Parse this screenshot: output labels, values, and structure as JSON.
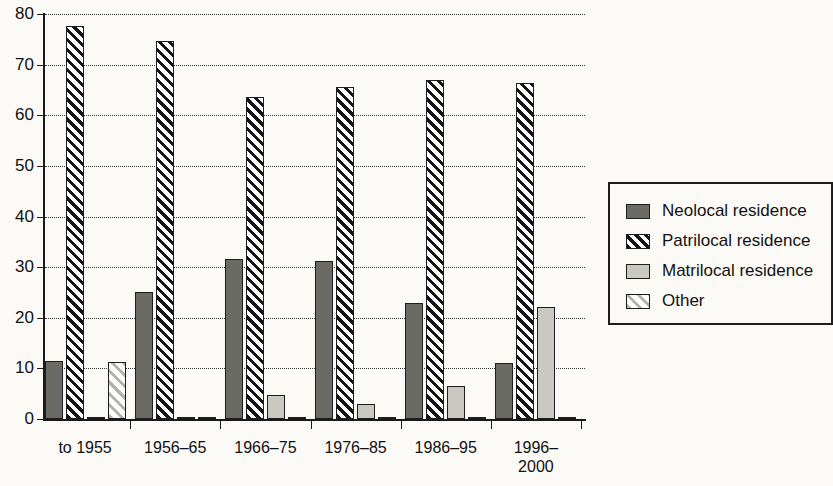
{
  "chart_data": {
    "type": "bar",
    "title": "",
    "subtitle": "",
    "xlabel": "",
    "ylabel": "",
    "ylim": [
      0,
      80
    ],
    "ytick_step": 10,
    "yticks": [
      0,
      10,
      20,
      30,
      40,
      50,
      60,
      70,
      80
    ],
    "ytick_labels": [
      "0",
      "10",
      "20",
      "30",
      "40",
      "50",
      "60",
      "70",
      "80"
    ],
    "grid": "horizontal-dotted",
    "legend_position": "right",
    "categories": [
      "to 1955",
      "1956–65",
      "1966–75",
      "1976–85",
      "1986–95",
      "1996–\n2000"
    ],
    "series": [
      {
        "name": "Neolocal residence",
        "key": "neolocal",
        "color": "#6b6b66",
        "pattern": "solid",
        "values": [
          11.5,
          25.0,
          31.6,
          31.2,
          22.9,
          11.0
        ]
      },
      {
        "name": "Patrilocal residence",
        "key": "patrilocal",
        "color": "#151515",
        "pattern": "diagonal-dark",
        "values": [
          77.6,
          74.6,
          63.6,
          65.6,
          67.0,
          66.3
        ]
      },
      {
        "name": "Matrilocal residence",
        "key": "matrilocal",
        "color": "#c9c9c2",
        "pattern": "solid",
        "values": [
          0.3,
          0.3,
          4.8,
          3.0,
          6.5,
          22.2
        ]
      },
      {
        "name": "Other",
        "key": "other",
        "color": "#b4b4ac",
        "pattern": "diagonal-light",
        "values": [
          11.3,
          0.3,
          0.4,
          0.3,
          0.4,
          0.4
        ]
      }
    ]
  },
  "legend": {
    "items": [
      {
        "label": "Neolocal residence",
        "key": "neolocal"
      },
      {
        "label": "Patrilocal residence",
        "key": "patrilocal"
      },
      {
        "label": "Matrilocal residence",
        "key": "matrilocal"
      },
      {
        "label": "Other",
        "key": "other"
      }
    ]
  }
}
